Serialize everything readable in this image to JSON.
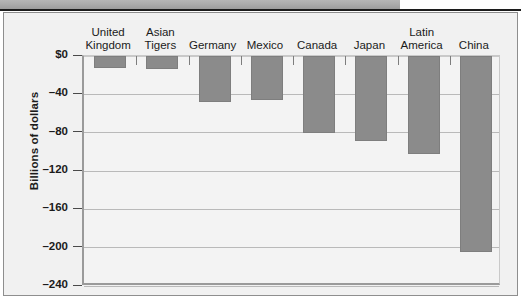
{
  "figure": {
    "y_axis_title": "Billions of dollars",
    "bar_color": "#8b8b8b",
    "panel_color": "#f1f1f1",
    "plot_color": "#f3f3f3"
  },
  "chart_data": {
    "type": "bar",
    "title": "",
    "xlabel": "",
    "ylabel": "Billions of dollars",
    "ylim": [
      -240,
      0
    ],
    "grid": true,
    "legend": "none",
    "orientation": "vertical",
    "ytick_labels": [
      "$0",
      "–40",
      "–80",
      "–120",
      "–160",
      "–200",
      "–240"
    ],
    "ytick_values": [
      0,
      -40,
      -80,
      -120,
      -160,
      -200,
      -240
    ],
    "categories": [
      "United Kingdom",
      "Asian Tigers",
      "Germany",
      "Mexico",
      "Canada",
      "Japan",
      "Latin America",
      "China"
    ],
    "category_lines": [
      [
        "United",
        "Kingdom"
      ],
      [
        "Asian",
        "Tigers"
      ],
      [
        "",
        "Germany"
      ],
      [
        "",
        "Mexico"
      ],
      [
        "",
        "Canada"
      ],
      [
        "",
        "Japan"
      ],
      [
        "Latin",
        "America"
      ],
      [
        "",
        "China"
      ]
    ],
    "values": [
      -12,
      -14,
      -48,
      -46,
      -80,
      -89,
      -102,
      -205
    ]
  }
}
